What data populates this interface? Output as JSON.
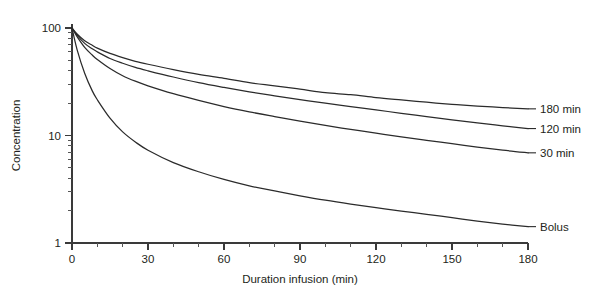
{
  "chart_data": {
    "type": "line",
    "title": "",
    "subtitle": "",
    "xlabel": "Duration infusion (min)",
    "ylabel": "Concentration",
    "xlim": [
      0,
      180
    ],
    "ylim": [
      1,
      100
    ],
    "yscale": "log",
    "xscale": "linear",
    "grid": false,
    "legend_position": "right-of-curve-end-labels",
    "xticks": [
      0,
      30,
      60,
      90,
      120,
      150,
      180
    ],
    "xticklabels": [
      "0",
      "30",
      "60",
      "90",
      "120",
      "150",
      "180"
    ],
    "xminorticks": [
      10,
      20,
      40,
      50,
      70,
      80,
      100,
      110,
      130,
      140,
      160,
      170
    ],
    "yticks": [
      1,
      10,
      100
    ],
    "yticklabels": [
      "1",
      "10",
      "100"
    ],
    "yminorticks": [
      2,
      3,
      4,
      5,
      6,
      7,
      8,
      9,
      20,
      30,
      40,
      50,
      60,
      70,
      80,
      90
    ],
    "x": [
      0,
      2,
      5,
      8,
      10,
      15,
      20,
      25,
      30,
      40,
      50,
      60,
      70,
      80,
      90,
      100,
      110,
      120,
      130,
      140,
      150,
      160,
      170,
      180
    ],
    "series": [
      {
        "name": "180 min",
        "label": "180 min",
        "values": [
          100,
          88,
          76,
          69,
          65,
          58,
          53,
          49,
          46,
          41,
          37,
          34,
          31,
          29,
          27,
          25,
          24,
          22.5,
          21.4,
          20.4,
          19.5,
          18.8,
          18.2,
          17.7
        ]
      },
      {
        "name": "120 min",
        "label": "120 min",
        "values": [
          100,
          86,
          72,
          64,
          60,
          52,
          47,
          43,
          40,
          35,
          31,
          28,
          25.5,
          23.4,
          21.6,
          20.0,
          18.6,
          17.3,
          16.1,
          15.0,
          14.0,
          13.1,
          12.3,
          11.6
        ]
      },
      {
        "name": "30 min",
        "label": "30 min",
        "values": [
          100,
          83,
          66,
          56,
          51,
          42,
          36,
          32,
          29,
          24.5,
          21.2,
          18.6,
          16.6,
          15.0,
          13.6,
          12.4,
          11.4,
          10.5,
          9.7,
          9.0,
          8.4,
          7.8,
          7.3,
          6.9
        ]
      },
      {
        "name": "Bolus",
        "label": "Bolus",
        "values": [
          100,
          63,
          38,
          26,
          21.5,
          14.5,
          10.8,
          8.7,
          7.3,
          5.6,
          4.6,
          3.9,
          3.4,
          3.05,
          2.75,
          2.5,
          2.3,
          2.13,
          1.98,
          1.85,
          1.72,
          1.6,
          1.5,
          1.42
        ]
      }
    ],
    "annotations": [
      {
        "text": "180 min",
        "at_x": 180,
        "at_y": 17.7
      },
      {
        "text": "120 min",
        "at_x": 180,
        "at_y": 11.6
      },
      {
        "text": "30 min",
        "at_x": 180,
        "at_y": 6.9
      },
      {
        "text": "Bolus",
        "at_x": 180,
        "at_y": 1.42
      }
    ],
    "colors": {
      "curve": "#2b2b2b",
      "axis": "#3a3a3a",
      "text": "#231f20",
      "background": "#ffffff"
    }
  }
}
